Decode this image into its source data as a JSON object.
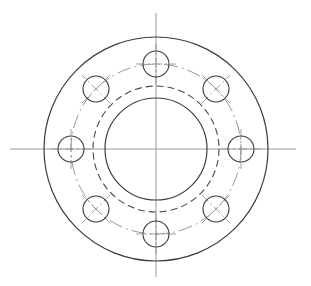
{
  "document": {
    "title": "Flange Plate Orthographic View",
    "view_label": "",
    "background_color": "#ffffff",
    "line_color": "#3c3c3c",
    "centerline_color": "#8c8c8c",
    "hidden_line_color": "#4a4a4a"
  },
  "canvas": {
    "width": 311,
    "height": 286
  },
  "geometry": {
    "center": {
      "x": 156,
      "y": 149
    },
    "outer_circle": {
      "name": "flange-outer-diameter",
      "radius": 112,
      "line_style": "continuous",
      "stroke_width": 1.2
    },
    "hidden_circle": {
      "name": "counterbore-hidden-diameter",
      "radius": 63,
      "line_style": "dashed",
      "stroke_width": 1.1,
      "dash_pattern": "7 4"
    },
    "bore_circle": {
      "name": "central-bore-diameter",
      "radius": 51,
      "line_style": "continuous",
      "stroke_width": 1.2
    },
    "bolt_circle": {
      "name": "bolt-hole-pitch-circle",
      "radius": 85,
      "line_style": "dash-dot",
      "stroke_width": 0.9,
      "dash_pattern": "14 4 2 4"
    },
    "bolt_holes": {
      "count": 8,
      "radius": 13,
      "start_angle_deg": -90,
      "angle_step_deg": 45,
      "line_style": "continuous",
      "stroke_width": 1.1,
      "centers": [
        {
          "label": "hole-top",
          "angle_deg": -90,
          "x": 156,
          "y": 64
        },
        {
          "label": "hole-upper-right",
          "angle_deg": -45,
          "x": 216,
          "y": 89
        },
        {
          "label": "hole-right",
          "angle_deg": 0,
          "x": 241,
          "y": 149
        },
        {
          "label": "hole-lower-right",
          "angle_deg": 45,
          "x": 216,
          "y": 209
        },
        {
          "label": "hole-bottom",
          "angle_deg": 90,
          "x": 156,
          "y": 234
        },
        {
          "label": "hole-lower-left",
          "angle_deg": 135,
          "x": 96,
          "y": 209
        },
        {
          "label": "hole-left",
          "angle_deg": 180,
          "x": 71,
          "y": 149
        },
        {
          "label": "hole-upper-left",
          "angle_deg": 225,
          "x": 96,
          "y": 89
        }
      ]
    },
    "center_lines": {
      "name": "principal-axes",
      "line_style": "dash-dot",
      "stroke_width": 0.9,
      "horizontal": {
        "x1": 10,
        "y1": 149,
        "x2": 296,
        "y2": 149
      },
      "vertical": {
        "x1": 156,
        "y1": 13,
        "x2": 156,
        "y2": 277
      }
    },
    "hole_center_marks": {
      "name": "hole-center-cross-marks",
      "arm_length": 20,
      "line_style": "dash-dot",
      "stroke_width": 0.8
    }
  }
}
